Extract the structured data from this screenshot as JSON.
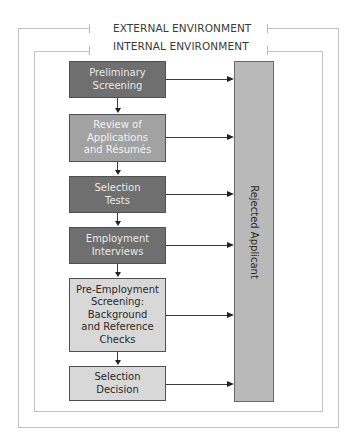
{
  "environment": {
    "external_label": "EXTERNAL ENVIRONMENT",
    "internal_label": "INTERNAL ENVIRONMENT"
  },
  "steps": [
    {
      "label": "Preliminary\nScreening",
      "shade": "dark"
    },
    {
      "label": "Review of\nApplications\nand Résumés",
      "shade": "medium"
    },
    {
      "label": "Selection\nTests",
      "shade": "dark"
    },
    {
      "label": "Employment\nInterviews",
      "shade": "dark"
    },
    {
      "label": "Pre-Employment\nScreening:\nBackground\nand Reference\nChecks",
      "shade": "light"
    },
    {
      "label": "Selection\nDecision",
      "shade": "light"
    }
  ],
  "rejected": {
    "label": "Rejected Applicant"
  },
  "colors": {
    "dark_box": "#6f6f6f",
    "medium_box": "#a2a2a2",
    "light_box": "#d8d8d8",
    "rejected_box": "#b9b9b9",
    "frame": "#c4c4c4"
  }
}
